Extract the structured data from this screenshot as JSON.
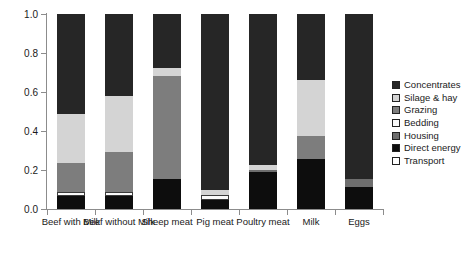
{
  "chart_data": {
    "type": "bar",
    "stacked": true,
    "title": "",
    "subtitle": "",
    "xlabel": "",
    "ylabel": "",
    "ylim": [
      0.0,
      1.0
    ],
    "grid": false,
    "legend_position": "right",
    "categories": [
      "Beef with Milk",
      "Beef without Milk",
      "Sheep meat",
      "Pig meat",
      "Poultry meat",
      "Milk",
      "Eggs"
    ],
    "y_ticks": [
      "0.0",
      "0.2",
      "0.4",
      "0.6",
      "0.8",
      "1.0"
    ],
    "y_tick_values": [
      0.0,
      0.2,
      0.4,
      0.6,
      0.8,
      1.0
    ],
    "series": [
      {
        "name": "Direct energy",
        "color": "#0d0d0d",
        "values": [
          0.068,
          0.067,
          0.155,
          0.045,
          0.19,
          0.255,
          0.115
        ]
      },
      {
        "name": "Housing",
        "color": "#6e6e6e",
        "values": [
          0.0,
          0.0,
          0.0,
          0.0,
          0.012,
          0.0,
          0.04
        ]
      },
      {
        "name": "Bedding",
        "color": "#fafafa",
        "values": [
          0.018,
          0.02,
          0.0,
          0.025,
          0.0,
          0.0,
          0.0
        ]
      },
      {
        "name": "Grazing",
        "color": "#7d7d7d",
        "values": [
          0.152,
          0.203,
          0.525,
          0.0,
          0.0,
          0.12,
          0.0
        ]
      },
      {
        "name": "Silage & hay",
        "color": "#d4d4d4",
        "values": [
          0.248,
          0.288,
          0.045,
          0.025,
          0.023,
          0.285,
          0.0
        ]
      },
      {
        "name": "Concentrates",
        "color": "#262626",
        "values": [
          0.514,
          0.422,
          0.275,
          0.905,
          0.775,
          0.34,
          0.845
        ]
      },
      {
        "name": "Transport",
        "color": "#ffffff",
        "values": [
          0.0,
          0.0,
          0.0,
          0.0,
          0.0,
          0.0,
          0.0
        ]
      }
    ],
    "legend_order": [
      "Concentrates",
      "Silage & hay",
      "Grazing",
      "Bedding",
      "Housing",
      "Direct energy",
      "Transport"
    ]
  },
  "legend": {
    "items": [
      {
        "label": "Concentrates",
        "color": "#262626"
      },
      {
        "label": "Silage & hay",
        "color": "#d4d4d4"
      },
      {
        "label": "Grazing",
        "color": "#7d7d7d"
      },
      {
        "label": "Bedding",
        "color": "#fafafa"
      },
      {
        "label": "Housing",
        "color": "#6e6e6e"
      },
      {
        "label": "Direct energy",
        "color": "#0d0d0d"
      },
      {
        "label": "Transport",
        "color": "#ffffff"
      }
    ]
  },
  "axes": {
    "y_min_label": "0.0",
    "y_max_label": "1.0"
  }
}
